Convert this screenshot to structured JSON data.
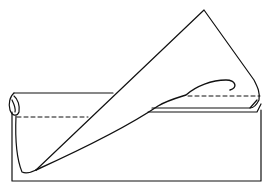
{
  "diagram": {
    "type": "origami-fold-illustration",
    "colors": {
      "line": "#111111",
      "background": "#ffffff"
    },
    "elements": [
      {
        "name": "paper-base-rectangle"
      },
      {
        "name": "rolled-top-band"
      },
      {
        "name": "folded-triangle-flap"
      },
      {
        "name": "curled-flap-tip"
      },
      {
        "name": "fold-line-dashed-left"
      },
      {
        "name": "fold-line-dashed-right"
      }
    ]
  }
}
